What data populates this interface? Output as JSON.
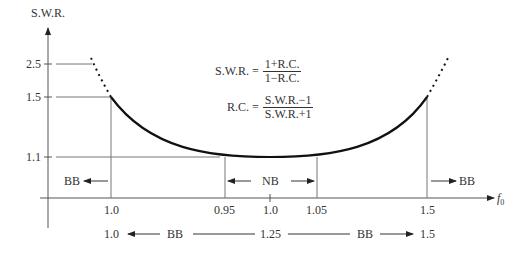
{
  "diagram": {
    "y_axis_label": "S.W.R.",
    "x_axis_label": "f",
    "x_axis_subscript": "0",
    "y_ticks": [
      {
        "label": "2.5",
        "value": 2.5
      },
      {
        "label": "1.5",
        "value": 1.5
      },
      {
        "label": "1.1",
        "value": 1.1
      }
    ],
    "x_ticks": [
      {
        "label": "1.0",
        "position": "left-bb-boundary"
      },
      {
        "label": "0.95",
        "position": "nb-left"
      },
      {
        "label": "1.0",
        "position": "center"
      },
      {
        "label": "1.05",
        "position": "nb-right"
      },
      {
        "label": "1.5",
        "position": "right-bb-boundary"
      }
    ],
    "formula_swr": {
      "lhs": "S.W.R. =",
      "num": "1+R.C.",
      "den": "1−R.C."
    },
    "formula_rc": {
      "lhs": "R.C. =",
      "num": "S.W.R.−1",
      "den": "S.W.R.+1"
    },
    "band_labels": {
      "bb_left": "BB",
      "nb": "NB",
      "bb_right": "BB"
    },
    "bottom_scale": {
      "left": "1.0",
      "bb_left": "BB",
      "center": "1.25",
      "bb_right": "BB",
      "right": "1.5"
    }
  }
}
